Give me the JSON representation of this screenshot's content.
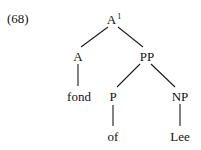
{
  "example_number": "(68)",
  "tree": {
    "root": {
      "label": "A",
      "superscript": "1"
    },
    "nodes": {
      "a": {
        "label": "A"
      },
      "pp": {
        "label": "PP"
      },
      "fond": {
        "label": "fond"
      },
      "p": {
        "label": "P"
      },
      "np": {
        "label": "NP"
      },
      "of": {
        "label": "of"
      },
      "lee": {
        "label": "Lee"
      }
    },
    "edges": [
      [
        "A1",
        "A"
      ],
      [
        "A1",
        "PP"
      ],
      [
        "A",
        "fond"
      ],
      [
        "PP",
        "P"
      ],
      [
        "PP",
        "NP"
      ],
      [
        "P",
        "of"
      ],
      [
        "NP",
        "Lee"
      ]
    ]
  }
}
